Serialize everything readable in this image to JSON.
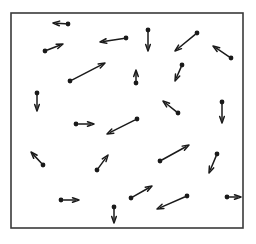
{
  "figure": {
    "background_color": "#ffffff",
    "stroke_color": "#1a1a1a",
    "width": 256,
    "height": 244
  },
  "frame": {
    "name": "plot-border",
    "x": 11,
    "y": 13,
    "width": 232,
    "height": 215,
    "stroke_color": "#3a3a3a",
    "stroke_width": 1.6,
    "fill": "none"
  },
  "chart_data": {
    "type": "scatter",
    "subtitle": "",
    "xlabel": "",
    "ylabel": "",
    "xlim": [
      11,
      243
    ],
    "ylim": [
      13,
      228
    ],
    "grid": false,
    "legend": null,
    "tick_labels": [],
    "annotations": [],
    "marker": "filled-circle",
    "marker_radius": 2.4,
    "arrow_head_length": 6.5,
    "arrow_head_width": 4.6,
    "series": [
      {
        "name": "arrows",
        "count": 22,
        "vectors": [
          {
            "id": 1,
            "label": "arrow-left-top-1",
            "x": 68,
            "y": 24,
            "tip_x": 53,
            "tip_y": 23,
            "dx": -15,
            "dy": -1,
            "angle_deg": 184
          },
          {
            "id": 2,
            "label": "arrow-upright-left-1",
            "x": 45,
            "y": 51,
            "tip_x": 63,
            "tip_y": 44,
            "dx": 18,
            "dy": -7,
            "angle_deg": 21
          },
          {
            "id": 3,
            "label": "arrow-left-top-2",
            "x": 126,
            "y": 38,
            "tip_x": 100,
            "tip_y": 42,
            "dx": -26,
            "dy": 4,
            "angle_deg": 171
          },
          {
            "id": 4,
            "label": "arrow-down-top-1",
            "x": 148,
            "y": 30,
            "tip_x": 148,
            "tip_y": 51,
            "dx": 0,
            "dy": 21,
            "angle_deg": 90
          },
          {
            "id": 5,
            "label": "arrow-downleft-top-1",
            "x": 197,
            "y": 33,
            "tip_x": 175,
            "tip_y": 51,
            "dx": -22,
            "dy": 18,
            "angle_deg": 141
          },
          {
            "id": 6,
            "label": "arrow-upleft-right-1",
            "x": 231,
            "y": 58,
            "tip_x": 213,
            "tip_y": 46,
            "dx": -18,
            "dy": -12,
            "angle_deg": 214
          },
          {
            "id": 7,
            "label": "arrow-upright-mid-1",
            "x": 70,
            "y": 81,
            "tip_x": 105,
            "tip_y": 63,
            "dx": 35,
            "dy": -18,
            "angle_deg": 27
          },
          {
            "id": 8,
            "label": "arrow-up-mid-1",
            "x": 136,
            "y": 83,
            "tip_x": 136,
            "tip_y": 70,
            "dx": 0,
            "dy": -13,
            "angle_deg": 270
          },
          {
            "id": 9,
            "label": "arrow-downleft-mid-1",
            "x": 182,
            "y": 65,
            "tip_x": 175,
            "tip_y": 81,
            "dx": -7,
            "dy": 16,
            "angle_deg": 114
          },
          {
            "id": 10,
            "label": "arrow-down-left-1",
            "x": 37,
            "y": 93,
            "tip_x": 37,
            "tip_y": 111,
            "dx": 0,
            "dy": 18,
            "angle_deg": 90
          },
          {
            "id": 11,
            "label": "arrow-upleft-mid-2",
            "x": 178,
            "y": 113,
            "tip_x": 163,
            "tip_y": 101,
            "dx": -15,
            "dy": -12,
            "angle_deg": 219
          },
          {
            "id": 12,
            "label": "arrow-down-right-1",
            "x": 222,
            "y": 102,
            "tip_x": 222,
            "tip_y": 123,
            "dx": 0,
            "dy": 21,
            "angle_deg": 90
          },
          {
            "id": 13,
            "label": "arrow-right-mid-1",
            "x": 76,
            "y": 124,
            "tip_x": 94,
            "tip_y": 124,
            "dx": 18,
            "dy": 0,
            "angle_deg": 0
          },
          {
            "id": 14,
            "label": "arrow-downleft-mid-2",
            "x": 137,
            "y": 119,
            "tip_x": 107,
            "tip_y": 134,
            "dx": -30,
            "dy": 15,
            "angle_deg": 153
          },
          {
            "id": 15,
            "label": "arrow-upleft-low-1",
            "x": 43,
            "y": 165,
            "tip_x": 31,
            "tip_y": 152,
            "dx": -12,
            "dy": -13,
            "angle_deg": 227
          },
          {
            "id": 16,
            "label": "arrow-upright-low-1",
            "x": 97,
            "y": 170,
            "tip_x": 108,
            "tip_y": 155,
            "dx": 11,
            "dy": -15,
            "angle_deg": 306
          },
          {
            "id": 17,
            "label": "arrow-upright-low-2",
            "x": 160,
            "y": 161,
            "tip_x": 189,
            "tip_y": 145,
            "dx": 29,
            "dy": -16,
            "angle_deg": 331
          },
          {
            "id": 18,
            "label": "arrow-downleft-low-1",
            "x": 217,
            "y": 154,
            "tip_x": 209,
            "tip_y": 173,
            "dx": -8,
            "dy": 19,
            "angle_deg": 113
          },
          {
            "id": 19,
            "label": "arrow-right-bottom-1",
            "x": 61,
            "y": 200,
            "tip_x": 79,
            "tip_y": 200,
            "dx": 18,
            "dy": 0,
            "angle_deg": 0
          },
          {
            "id": 20,
            "label": "arrow-down-bottom-1",
            "x": 114,
            "y": 207,
            "tip_x": 114,
            "tip_y": 223,
            "dx": 0,
            "dy": 16,
            "angle_deg": 90
          },
          {
            "id": 21,
            "label": "arrow-upright-bottom-1",
            "x": 131,
            "y": 198,
            "tip_x": 152,
            "tip_y": 186,
            "dx": 21,
            "dy": -12,
            "angle_deg": 330
          },
          {
            "id": 22,
            "label": "arrow-downleft-bottom-1",
            "x": 187,
            "y": 196,
            "tip_x": 157,
            "tip_y": 209,
            "dx": -30,
            "dy": 13,
            "angle_deg": 157
          },
          {
            "id": 23,
            "label": "arrow-right-bottom-2",
            "x": 227,
            "y": 197,
            "tip_x": 241,
            "tip_y": 197,
            "dx": 14,
            "dy": 0,
            "angle_deg": 0
          }
        ]
      }
    ]
  }
}
